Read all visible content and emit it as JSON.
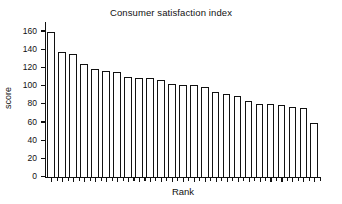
{
  "chart_data": {
    "type": "bar",
    "title": "Consumer satisfaction index",
    "xlabel": "Rank",
    "ylabel": "score",
    "grid": false,
    "legend": false,
    "ylim": [
      0,
      170
    ],
    "y_ticks": [
      0,
      20,
      40,
      60,
      80,
      100,
      120,
      140,
      160
    ],
    "categories": [
      "1",
      "2",
      "3",
      "4",
      "5",
      "6",
      "7",
      "8",
      "9",
      "10",
      "11",
      "12",
      "13",
      "14",
      "15",
      "16",
      "17",
      "18",
      "19",
      "20",
      "21",
      "22",
      "23",
      "24",
      "25"
    ],
    "values": [
      159,
      137,
      135,
      124,
      118,
      116,
      115,
      110,
      108,
      108,
      106,
      102,
      101,
      101,
      98,
      93,
      91,
      89,
      83,
      80,
      80,
      79,
      76,
      75,
      59
    ],
    "bar_fill": "#ffffff",
    "bar_edge": "#111111",
    "axis_color": "#111111",
    "background": "#ffffff"
  },
  "figure": {
    "title": "Consumer satisfaction index",
    "x_axis_title": "Rank",
    "y_axis_title": "score"
  }
}
